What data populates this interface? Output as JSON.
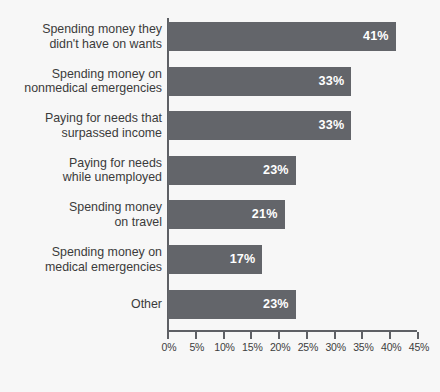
{
  "chart_data": {
    "type": "bar",
    "orientation": "horizontal",
    "title": "",
    "subtitle": "",
    "xlabel": "",
    "ylabel": "",
    "xlim": [
      0,
      45
    ],
    "grid": false,
    "legend": null,
    "bar_color": "#63656a",
    "background_color": "#f7f7f7",
    "axis_color": "#5e6065",
    "label_color": "#3b3b3b",
    "value_label_color": "#ffffff",
    "categories": [
      "Spending money they\ndidn't have on wants",
      "Spending money on\nnonmedical emergencies",
      "Paying for needs that\nsurpassed income",
      "Paying for needs\nwhile unemployed",
      "Spending money\non travel",
      "Spending money on\nmedical emergencies",
      "Other"
    ],
    "values": [
      41,
      33,
      33,
      23,
      21,
      17,
      23
    ],
    "value_labels": [
      "41%",
      "33%",
      "33%",
      "23%",
      "21%",
      "17%",
      "23%"
    ],
    "xticks": [
      0,
      5,
      10,
      15,
      20,
      25,
      30,
      35,
      40,
      45
    ],
    "xtick_labels": [
      "0%",
      "5%",
      "10%",
      "15%",
      "20%",
      "25%",
      "30%",
      "35%",
      "40%",
      "45%"
    ]
  }
}
